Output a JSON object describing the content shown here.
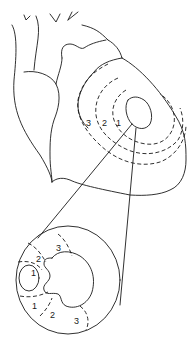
{
  "diagram": {
    "heart_zone_labels": [
      "3",
      "2",
      "1"
    ],
    "cross_section_labels": {
      "upper": [
        "3",
        "2",
        "1"
      ],
      "lower": [
        "1",
        "2",
        "3"
      ]
    },
    "colors": {
      "stroke": "#1a1a1a",
      "background": "#ffffff"
    }
  }
}
